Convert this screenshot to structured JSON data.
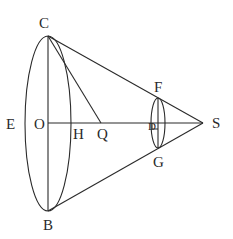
{
  "diagram": {
    "type": "geometric-figure",
    "stroke_color": "#2a2a2a",
    "background": "#ffffff",
    "labels": {
      "C": "C",
      "B": "B",
      "E": "E",
      "O": "O",
      "H": "H",
      "Q": "Q",
      "D": "D",
      "F": "F",
      "G": "G",
      "S": "S"
    },
    "points": {
      "C": [
        48,
        36
      ],
      "B": [
        48,
        211
      ],
      "O": [
        48,
        123
      ],
      "H": [
        70,
        123
      ],
      "Q": [
        101,
        123
      ],
      "D": [
        158,
        123
      ],
      "F": [
        158,
        98
      ],
      "G": [
        158,
        148
      ],
      "S": [
        203,
        123
      ]
    },
    "segments": [
      [
        "C",
        "S"
      ],
      [
        "B",
        "S"
      ],
      [
        "C",
        "B"
      ],
      [
        "O",
        "S"
      ],
      [
        "C",
        "Q"
      ],
      [
        "F",
        "G"
      ]
    ],
    "ellipses": [
      {
        "name": "base",
        "center": "O",
        "rx": 23,
        "ry": 88
      },
      {
        "name": "section",
        "center": "D",
        "rx": 7,
        "ry": 25
      }
    ]
  }
}
